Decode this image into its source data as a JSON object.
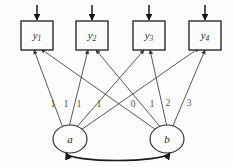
{
  "diagram": {
    "type": "sem-path-diagram",
    "background_color": "#fdfdfd",
    "line_color": "#3a3a3a",
    "node_stroke_color": "#1d1d1d",
    "label_color": "#2b2b2b",
    "edge_label_color": "#5a5a5a",
    "observed": [
      {
        "id": "y1",
        "base": "y",
        "sub": "1",
        "label": "y1"
      },
      {
        "id": "y2",
        "base": "y",
        "sub": "2",
        "label": "y2"
      },
      {
        "id": "y3",
        "base": "y",
        "sub": "3",
        "label": "y3"
      },
      {
        "id": "y4",
        "base": "y",
        "sub": "4",
        "label": "y4"
      }
    ],
    "latent": [
      {
        "id": "a",
        "label": "a"
      },
      {
        "id": "b",
        "label": "b"
      }
    ],
    "loadings_intercept": [
      "1",
      "1",
      "1",
      "1"
    ],
    "loadings_slope": [
      "0",
      "1",
      "2",
      "3"
    ],
    "covariance": {
      "from": "a",
      "to": "b",
      "label": "",
      "style": "double-headed"
    },
    "residuals": [
      {
        "target": "y1"
      },
      {
        "target": "y2"
      },
      {
        "target": "y3"
      },
      {
        "target": "y4"
      }
    ]
  }
}
